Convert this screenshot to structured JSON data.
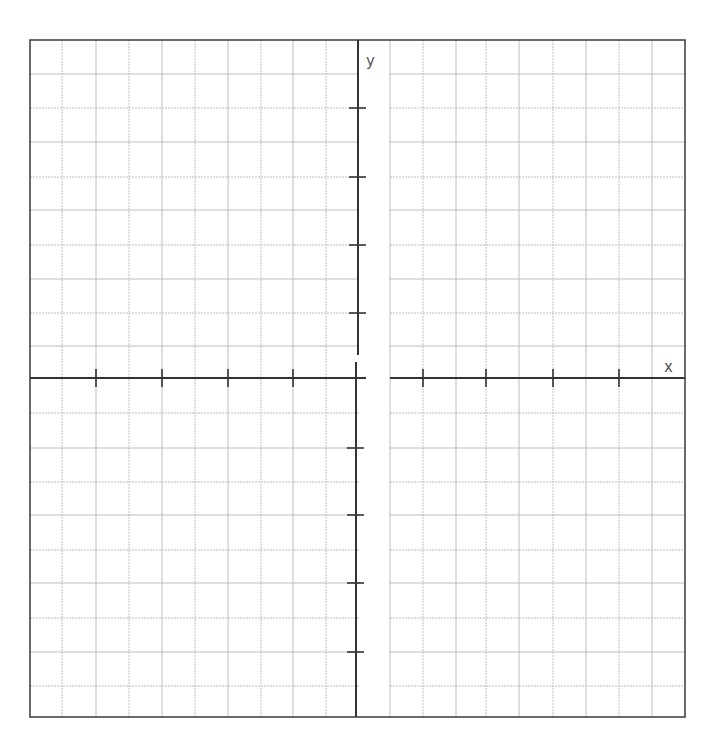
{
  "graph": {
    "x_label": "x",
    "y_label": "y",
    "colors": {
      "border": "#3a3a3a",
      "axis": "#333333",
      "grid": "#bdbdbd",
      "label": "#555555",
      "background": "#ffffff"
    },
    "frame": {
      "left": 30,
      "top": 40,
      "right": 685,
      "bottom": 717
    },
    "y_axis": {
      "upper_x": 358,
      "lower_x": 356,
      "upper_top": 40,
      "upper_bottom": 355,
      "lower_top": 362,
      "lower_bottom": 717
    },
    "x_axis": {
      "y": 378,
      "left_start": 30,
      "left_end": 358,
      "right_start": 390,
      "right_end": 685
    },
    "vertical_grid_x": [
      62,
      96,
      129,
      162,
      195,
      228,
      261,
      293,
      326,
      390,
      423,
      456,
      486,
      519,
      553,
      586,
      619,
      652
    ],
    "horizontal_grid_y": [
      74,
      108,
      142,
      177,
      210,
      245,
      279,
      313,
      346,
      413,
      448,
      482,
      515,
      550,
      583,
      618,
      652,
      686
    ],
    "x_ticks": [
      96,
      162,
      228,
      293,
      423,
      486,
      553,
      619
    ],
    "y_ticks": [
      108,
      177,
      245,
      313,
      448,
      515,
      583,
      652
    ]
  }
}
